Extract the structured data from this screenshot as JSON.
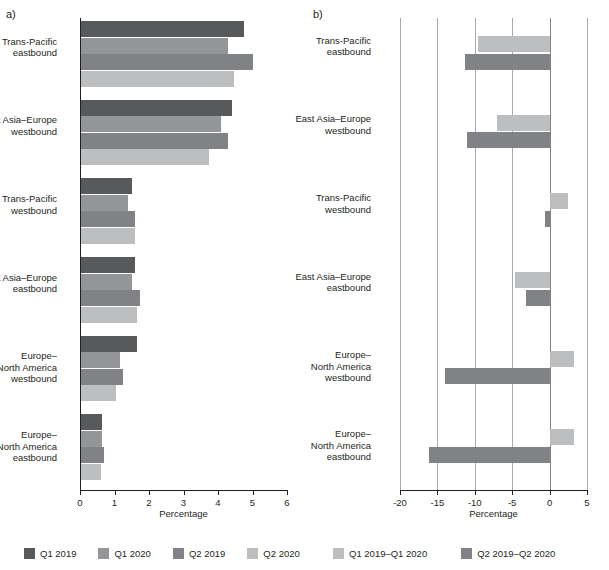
{
  "figure": {
    "panels": [
      {
        "letter": "a)",
        "axis_title": "Percentage",
        "xlim": [
          0,
          6
        ],
        "xticks": [
          "0",
          "1",
          "2",
          "3",
          "4",
          "5",
          "6"
        ]
      },
      {
        "letter": "b)",
        "axis_title": "Percentage",
        "xlim": [
          -20,
          5
        ],
        "xticks": [
          "-20",
          "-15",
          "-10",
          "-5",
          "0",
          "5"
        ]
      }
    ]
  },
  "colors": {
    "q1_2019": "#58595b",
    "q1_2020": "#939598",
    "q2_2019": "#808285",
    "q2_2020": "#bcbec0",
    "diff_q1": "#bcbec0",
    "diff_q2": "#808285",
    "gridline": "#a7a9ac",
    "axis": "#231f20",
    "text": "#231f20"
  },
  "legend_a": [
    {
      "label": "Q1 2019",
      "color_key": "q1_2019"
    },
    {
      "label": "Q1 2020",
      "color_key": "q1_2020"
    },
    {
      "label": "Q2 2019",
      "color_key": "q2_2019"
    },
    {
      "label": "Q2 2020",
      "color_key": "q2_2020"
    }
  ],
  "legend_b": [
    {
      "label": "Q1 2019–Q1 2020",
      "color_key": "diff_q1"
    },
    {
      "label": "Q2 2019–Q2 2020",
      "color_key": "diff_q2"
    }
  ],
  "chart_data": [
    {
      "type": "bar",
      "orientation": "horizontal",
      "panel": "a)",
      "title": "",
      "xlabel": "Percentage",
      "ylabel": "",
      "xlim": [
        0,
        6
      ],
      "xticks": [
        0,
        1,
        2,
        3,
        4,
        5,
        6
      ],
      "grid": false,
      "legend_position": "below",
      "categories": [
        "Trans-Pacific eastbound",
        "East Asia–Europe westbound",
        "Trans-Pacific westbound",
        "East Asia–Europe eastbound",
        "Europe–North America westbound",
        "Europe–North America eastbound"
      ],
      "series": [
        {
          "name": "Q1 2019",
          "values": [
            4.75,
            4.4,
            1.5,
            1.6,
            1.65,
            0.65
          ]
        },
        {
          "name": "Q1 2020",
          "values": [
            4.3,
            4.1,
            1.4,
            1.5,
            1.15,
            0.65
          ]
        },
        {
          "name": "Q2 2019",
          "values": [
            5.0,
            4.3,
            1.6,
            1.75,
            1.25,
            0.7
          ]
        },
        {
          "name": "Q2 2020",
          "values": [
            4.45,
            3.75,
            1.6,
            1.65,
            1.05,
            0.6
          ]
        }
      ]
    },
    {
      "type": "bar",
      "orientation": "horizontal",
      "panel": "b)",
      "title": "",
      "xlabel": "Percentage",
      "ylabel": "",
      "xlim": [
        -20,
        5
      ],
      "xticks": [
        -20,
        -15,
        -10,
        -5,
        0,
        5
      ],
      "grid": true,
      "legend_position": "below",
      "categories": [
        "Trans-Pacific eastbound",
        "East Asia–Europe westbound",
        "Trans-Pacific westbound",
        "East Asia–Europe eastbound",
        "Europe–North America westbound",
        "Europe–North America eastbound"
      ],
      "series": [
        {
          "name": "Q1 2019–Q1 2020",
          "values": [
            -9.6,
            -7.0,
            2.4,
            -4.6,
            3.3,
            3.3
          ]
        },
        {
          "name": "Q2 2019–Q2 2020",
          "values": [
            -11.3,
            -11.0,
            -0.6,
            -3.2,
            -14.0,
            -16.1
          ]
        }
      ]
    }
  ]
}
